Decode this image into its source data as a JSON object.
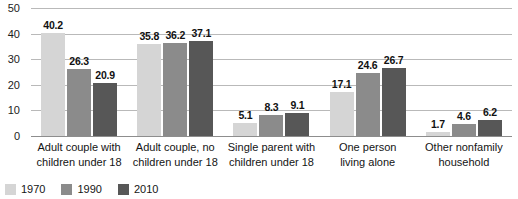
{
  "chart_data": {
    "type": "bar",
    "title": "",
    "xlabel": "",
    "ylabel": "",
    "ylim": [
      0,
      50
    ],
    "yticks": [
      0,
      10,
      20,
      30,
      40,
      50
    ],
    "grid": true,
    "legend_position": "bottom-left",
    "categories": [
      "Adult couple with children under 18",
      "Adult couple, no children under 18",
      "Single parent with children under 18",
      "One person living alone",
      "Other nonfamily household"
    ],
    "category_lines": [
      [
        "Adult couple with",
        "children under 18"
      ],
      [
        "Adult couple, no",
        "children under 18"
      ],
      [
        "Single parent with",
        "children under 18"
      ],
      [
        "One person",
        "living alone"
      ],
      [
        "Other nonfamily",
        "household"
      ]
    ],
    "series": [
      {
        "name": "1970",
        "color": "#d5d5d5",
        "values": [
          40.2,
          35.8,
          5.1,
          17.1,
          1.7
        ]
      },
      {
        "name": "1990",
        "color": "#8b8b8b",
        "values": [
          26.3,
          36.2,
          8.3,
          24.6,
          4.6
        ]
      },
      {
        "name": "2010",
        "color": "#575757",
        "values": [
          20.9,
          37.1,
          9.1,
          26.7,
          6.2
        ]
      }
    ]
  }
}
